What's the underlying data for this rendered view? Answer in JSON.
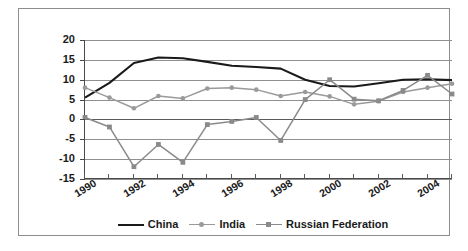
{
  "chart_data": {
    "type": "line",
    "title": "",
    "xlabel": "",
    "ylabel": "",
    "ylim": [
      -15,
      20
    ],
    "yticks": [
      20,
      15,
      10,
      5,
      0,
      -5,
      -10,
      -15
    ],
    "ytick_labels": [
      "20",
      "15",
      "10",
      "5",
      "0",
      "-5",
      "-10",
      "-15"
    ],
    "grid": true,
    "legend_position": "bottom",
    "x": [
      1990,
      1991,
      1992,
      1993,
      1994,
      1995,
      1996,
      1997,
      1998,
      1999,
      2000,
      2001,
      2002,
      2003,
      2004,
      2005
    ],
    "xtick_labels": [
      "1990",
      "1992",
      "1994",
      "1996",
      "1998",
      "2000",
      "2002",
      "2004"
    ],
    "xticks": [
      1990,
      1992,
      1994,
      1996,
      1998,
      2000,
      2002,
      2004
    ],
    "series": [
      {
        "name": "China",
        "color": "#1a1a1a",
        "marker": "none",
        "values": [
          5.5,
          9.2,
          14.2,
          15.6,
          15.4,
          14.5,
          13.5,
          13.2,
          12.8,
          10.0,
          8.4,
          8.3,
          9.1,
          10.0,
          10.1,
          9.9
        ]
      },
      {
        "name": "India",
        "color": "#9a9a9a",
        "marker": "circle",
        "values": [
          8.0,
          5.5,
          2.8,
          5.9,
          5.3,
          7.8,
          8.0,
          7.5,
          5.9,
          6.9,
          5.8,
          3.8,
          4.6,
          6.9,
          8.0,
          9.0
        ]
      },
      {
        "name": "Russian Federation",
        "color": "#8a8a8a",
        "marker": "square",
        "values": [
          0.5,
          -1.9,
          -11.9,
          -6.3,
          -10.8,
          -1.3,
          -0.5,
          0.5,
          -5.3,
          5.0,
          10.0,
          5.1,
          4.7,
          7.3,
          11.1,
          6.4
        ]
      }
    ]
  },
  "legend": {
    "entries": [
      {
        "label": "China"
      },
      {
        "label": "India"
      },
      {
        "label": "Russian Federation"
      }
    ]
  }
}
